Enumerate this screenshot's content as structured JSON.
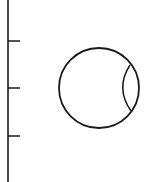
{
  "diagram": {
    "background": "#ffffff",
    "stroke_color": "#1a1a1a",
    "axis": {
      "x": 8,
      "y1": 0,
      "y2": 182,
      "tick_length": 12,
      "ticks_y": [
        41,
        88,
        136
      ]
    },
    "circle": {
      "cx": 99,
      "cy": 88,
      "r": 40
    },
    "inner_arc": {
      "start": [
        130,
        65
      ],
      "control": [
        115,
        88
      ],
      "end": [
        131,
        111
      ]
    }
  }
}
